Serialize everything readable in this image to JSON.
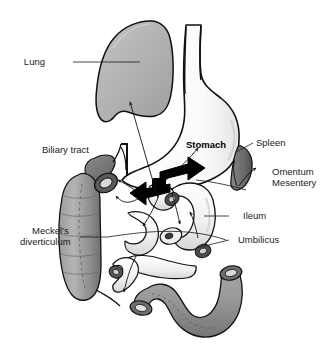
{
  "figure": {
    "background_color": "#ffffff",
    "outline_color": "#111111",
    "label_color": "#1b1b1b"
  },
  "labels": {
    "lung": "Lung",
    "biliary_tract": "Biliary tract",
    "stomach": "Stomach",
    "spleen": "Spleen",
    "omentum": "Omentum",
    "mesentery": "Mesentery",
    "ileum": "Ileum",
    "umbilicus": "Umbilicus",
    "meckels": "Meckel's",
    "diverticulum": "diverticulum"
  },
  "organs": [
    {
      "name": "lung",
      "label": "Lung",
      "fill": "#a8a8a8",
      "description": "Large shaded lung / diaphragm silhouette, upper left"
    },
    {
      "name": "stomach",
      "label": "Stomach",
      "fill": "#fbfbfb",
      "description": "Pale stomach with esophagus running vertically, upper right"
    },
    {
      "name": "spleen",
      "label": "Spleen",
      "fill": "#6e6e6e",
      "description": "Dark crescent-shaped spleen to the right of the stomach"
    },
    {
      "name": "gallbladder",
      "label": "Biliary tract",
      "fill": "#777777",
      "description": "Dark pear-shaped gallbladder with bile ducts, left of stomach"
    },
    {
      "name": "colon-descending",
      "label": "Meckel's diverticulum",
      "fill": "#8e8e8e",
      "description": "Gray haustrated colon segment running vertically on the left"
    },
    {
      "name": "colon-sigmoid",
      "label": "",
      "fill": "#8e8e8e",
      "description": "Gray looped colon segment across the lower middle"
    },
    {
      "name": "ileum",
      "label": "Ileum",
      "fill": "#f2f2f2",
      "description": "Pale curved small-bowel loop at center right"
    },
    {
      "name": "umbilicus",
      "label": "Umbilicus",
      "fill": "#e8e8e8",
      "description": "Small oval umbilical structure below the ileum loop"
    }
  ],
  "annotations": {
    "block_arrows": 2,
    "thin_arrows": 9,
    "leader_lines": 7
  },
  "fills": {
    "lung_light": "#c9c9c9",
    "lung_dark": "#9a9a9a",
    "stomach": "#fdfdfd",
    "stomach_shade": "#e6e6e6",
    "colon_light": "#a6a6a6",
    "colon_dark": "#7b7b7b",
    "spleen": "#6e6e6e",
    "gallbladder": "#7a7a7a",
    "bowel_pale": "#f4f4f4",
    "bowel_shade": "#d8d8d8",
    "black": "#000000"
  }
}
